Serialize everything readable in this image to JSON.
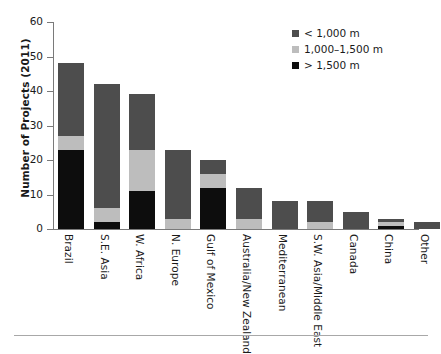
{
  "chart_data": {
    "type": "bar",
    "subtype": "stacked-vertical",
    "title": "",
    "xlabel": "",
    "ylabel": "Number of Projects (2011)",
    "ylim": [
      0,
      60
    ],
    "yticks": [
      0,
      10,
      20,
      30,
      40,
      50,
      60
    ],
    "ytick_labels": [
      "0",
      "10",
      "20",
      "30",
      "40",
      "50",
      "60"
    ],
    "grid": false,
    "legend_position": "top-right",
    "categories": [
      "Brazil",
      "S.E. Asia",
      "W. Africa",
      "N. Europe",
      "Gulf of Mexico",
      "Australia/New Zealand",
      "Mediterranean",
      "S.W. Asia/Middle East",
      "Canada",
      "China",
      "Other"
    ],
    "series": [
      {
        "name": "> 1,500 m",
        "color": "#0d0d0d",
        "values": [
          23,
          2,
          11,
          0,
          12,
          0,
          0,
          0,
          0,
          1,
          0
        ]
      },
      {
        "name": "1,000–1,500 m",
        "color": "#bdbdbd",
        "values": [
          4,
          4,
          12,
          3,
          4,
          3,
          0,
          2,
          0,
          1,
          0
        ]
      },
      {
        "name": "< 1,000 m",
        "color": "#4d4d4d",
        "values": [
          21,
          36,
          16,
          20,
          4,
          9,
          8,
          6,
          5,
          1,
          2
        ]
      }
    ],
    "totals": [
      48,
      42,
      39,
      23,
      20,
      12,
      8,
      8,
      5,
      3,
      2
    ],
    "stack_order_bottom_to_top": [
      "> 1,500 m",
      "1,000–1,500 m",
      "< 1,000 m"
    ]
  },
  "legend": {
    "items": [
      {
        "label": "< 1,000 m",
        "color": "#4d4d4d"
      },
      {
        "label": "1,000–1,500 m",
        "color": "#bdbdbd"
      },
      {
        "label": "> 1,500 m",
        "color": "#0d0d0d"
      }
    ]
  },
  "colors": {
    "shallow": "#4d4d4d",
    "mid": "#bdbdbd",
    "deep": "#0d0d0d",
    "axis": "#7a7a7a",
    "text": "#1a1a1a",
    "background": "#ffffff",
    "rule": "#a8a8a8"
  }
}
